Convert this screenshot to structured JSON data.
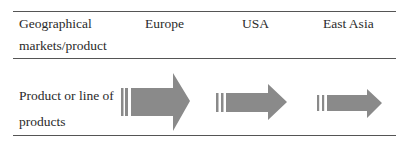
{
  "table": {
    "header": {
      "row_label": "Geographical markets/product",
      "columns": [
        "Europe",
        "USA",
        "East Asia"
      ]
    },
    "rows": [
      {
        "label": "Product or line of products",
        "cells": [
          {
            "market": "Europe",
            "icon": "thick-arrow-right-large"
          },
          {
            "market": "USA",
            "icon": "thick-arrow-right-medium"
          },
          {
            "market": "East Asia",
            "icon": "thick-arrow-right-small"
          }
        ]
      }
    ]
  },
  "colors": {
    "arrow_fill": "#8a8a8a",
    "rule": "#555555",
    "text": "#2a2a2a"
  }
}
